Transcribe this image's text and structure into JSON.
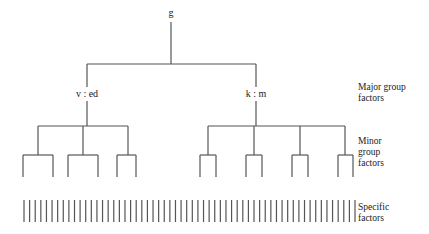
{
  "diagram": {
    "line_color": "#555555",
    "root": {
      "label": "g",
      "x": 171,
      "label_y": 8,
      "stem_top": 22,
      "branch_y": 64
    },
    "major_groups": [
      {
        "label": "v : ed",
        "x": 87,
        "label_y": 89,
        "branch_y": 126,
        "minor_groups": [
          {
            "x": 38,
            "leaves": [
              23,
              53
            ]
          },
          {
            "x": 83,
            "leaves": [
              68,
              98
            ]
          },
          {
            "x": 128,
            "leaves": [
              117,
              136
            ]
          }
        ]
      },
      {
        "label": "k : m",
        "x": 256,
        "label_y": 89,
        "branch_y": 126,
        "minor_groups": [
          {
            "x": 208,
            "leaves": [
              200,
              216
            ]
          },
          {
            "x": 254,
            "leaves": [
              246,
              262
            ]
          },
          {
            "x": 300,
            "leaves": [
              292,
              308
            ]
          },
          {
            "x": 345,
            "leaves": [
              338,
              353
            ]
          }
        ]
      }
    ],
    "minor_branch_y": 155,
    "leaf_bottom_y": 177,
    "specific_factors": {
      "count": 60,
      "x_start": 24,
      "x_end": 355,
      "top_y": 200,
      "bottom_y": 222
    },
    "side_labels": {
      "major": {
        "lines": [
          "Major group",
          "factors"
        ],
        "top": 82
      },
      "minor": {
        "lines": [
          "Minor",
          "group",
          "factors"
        ],
        "top": 136
      },
      "specific": {
        "lines": [
          "Specific",
          "factors"
        ],
        "top": 202
      }
    }
  }
}
